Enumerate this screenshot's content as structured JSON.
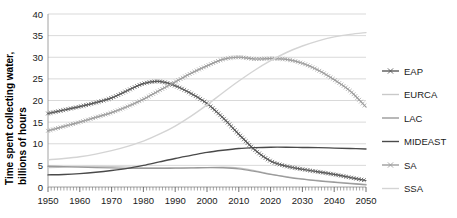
{
  "chart_data": {
    "type": "line",
    "title": "",
    "xlabel": "",
    "ylabel": "Time spent collecting water,\nbillions of hours",
    "ylabel_line1": "Time spent collecting water,",
    "ylabel_line2": "billions of hours",
    "xlim": [
      1950,
      2050
    ],
    "ylim": [
      0,
      40
    ],
    "ytick_step": 5,
    "xtick_step": 10,
    "x_minor_tick_step": 1,
    "grid": "horizontal",
    "legend_position": "right",
    "y_ticks": [
      "0",
      "5",
      "10",
      "15",
      "20",
      "25",
      "30",
      "35",
      "40"
    ],
    "x_ticks": [
      "1950",
      "1960",
      "1970",
      "1980",
      "1990",
      "2000",
      "2010",
      "2020",
      "2030",
      "2040",
      "2050"
    ],
    "x": [
      1950,
      1955,
      1960,
      1965,
      1970,
      1975,
      1980,
      1985,
      1990,
      1995,
      2000,
      2005,
      2010,
      2015,
      2020,
      2025,
      2030,
      2035,
      2040,
      2045,
      2050
    ],
    "series": [
      {
        "name": "EAP",
        "color": "#595959",
        "marker": "x",
        "width": 1.2,
        "values": [
          17.0,
          17.8,
          18.6,
          19.5,
          20.6,
          22.3,
          23.9,
          24.4,
          23.4,
          21.6,
          19.3,
          16.0,
          12.2,
          8.6,
          6.0,
          4.8,
          4.1,
          3.5,
          2.9,
          2.2,
          1.5
        ]
      },
      {
        "name": "EURCA",
        "color": "#c9c9c9",
        "marker": "none",
        "width": 1.3,
        "values": [
          4.5,
          4.6,
          4.7,
          4.75,
          4.7,
          4.6,
          4.5,
          4.45,
          4.4,
          4.4,
          4.5,
          4.6,
          4.4,
          3.8,
          3.0,
          2.4,
          1.9,
          1.5,
          1.2,
          0.9,
          0.6
        ]
      },
      {
        "name": "LAC",
        "color": "#9a9a9a",
        "marker": "none",
        "width": 1.3,
        "values": [
          4.8,
          4.7,
          4.6,
          4.5,
          4.4,
          4.3,
          4.3,
          4.3,
          4.35,
          4.4,
          4.5,
          4.45,
          4.2,
          3.6,
          2.9,
          2.3,
          1.8,
          1.4,
          1.1,
          0.8,
          0.5
        ]
      },
      {
        "name": "MIDEAST",
        "color": "#4a4a4a",
        "marker": "none",
        "width": 1.4,
        "values": [
          2.8,
          2.9,
          3.1,
          3.4,
          3.8,
          4.3,
          5.0,
          5.8,
          6.6,
          7.3,
          8.0,
          8.5,
          8.9,
          9.1,
          9.2,
          9.2,
          9.15,
          9.1,
          9.0,
          8.9,
          8.8
        ]
      },
      {
        "name": "SA",
        "color": "#9e9e9e",
        "marker": "x",
        "width": 1.2,
        "values": [
          13.0,
          14.0,
          15.0,
          16.1,
          17.2,
          18.6,
          20.3,
          22.3,
          24.3,
          26.3,
          28.0,
          29.5,
          30.0,
          29.6,
          29.7,
          29.5,
          28.6,
          27.0,
          24.8,
          22.2,
          18.5
        ]
      },
      {
        "name": "SSA",
        "color": "#d4d4d4",
        "marker": "none",
        "width": 1.4,
        "values": [
          6.3,
          6.6,
          7.0,
          7.6,
          8.4,
          9.4,
          10.6,
          12.2,
          14.1,
          16.4,
          19.0,
          21.8,
          24.5,
          27.0,
          29.2,
          31.1,
          32.6,
          33.8,
          34.7,
          35.3,
          35.7
        ]
      }
    ]
  },
  "legend": {
    "items": [
      {
        "label": "EAP",
        "color": "#595959",
        "marker": "x"
      },
      {
        "label": "EURCA",
        "color": "#c9c9c9",
        "marker": "none"
      },
      {
        "label": "LAC",
        "color": "#9a9a9a",
        "marker": "none"
      },
      {
        "label": "MIDEAST",
        "color": "#4a4a4a",
        "marker": "none"
      },
      {
        "label": "SA",
        "color": "#9e9e9e",
        "marker": "x"
      },
      {
        "label": "SSA",
        "color": "#d4d4d4",
        "marker": "none"
      }
    ]
  }
}
